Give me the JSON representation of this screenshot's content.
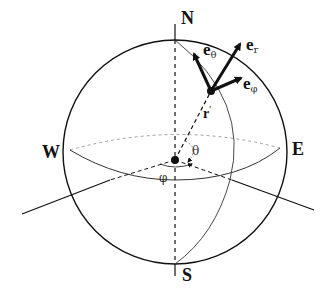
{
  "diagram": {
    "type": "spherical-coordinates",
    "poles": {
      "north": "N",
      "south": "S"
    },
    "directions": {
      "west": "W",
      "east": "E"
    },
    "position_vector": {
      "label": "r",
      "superscript": "'"
    },
    "angles": {
      "polar": "θ",
      "azimuthal": "φ"
    },
    "unit_vectors": {
      "e_r": {
        "base": "e",
        "sub": "r"
      },
      "e_theta": {
        "base": "e",
        "sub": "θ"
      },
      "e_phi": {
        "base": "e",
        "sub": "φ"
      }
    },
    "colors": {
      "stroke": "#111111",
      "dashed_equator": "#999999",
      "background": "#ffffff"
    }
  }
}
